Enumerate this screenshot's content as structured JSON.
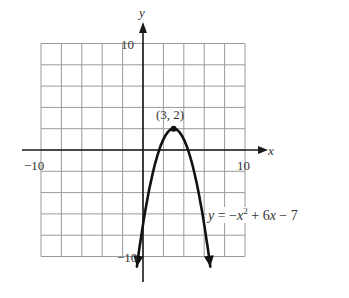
{
  "chart_data": {
    "type": "line",
    "title": "",
    "xlabel": "x",
    "ylabel": "y",
    "xlim": [
      -10,
      10
    ],
    "ylim": [
      -10,
      10
    ],
    "grid": true,
    "grid_step": 2,
    "tick_labels": {
      "x": [
        {
          "value": -10,
          "label": "−10"
        },
        {
          "value": 10,
          "label": "10"
        }
      ],
      "y": [
        {
          "value": 10,
          "label": "10"
        },
        {
          "value": -10,
          "label": "−10"
        }
      ]
    },
    "series": [
      {
        "name": "y = -x^2 + 6x - 7",
        "equation": "y = −x² + 6x − 7",
        "coefficients": {
          "a": -1,
          "b": 6,
          "c": -7
        },
        "arrows_at_ends": true,
        "x": [
          -0.6,
          0,
          1,
          2,
          3,
          4,
          5,
          6,
          6.6
        ],
        "values": [
          -11.0,
          -7,
          -2,
          1,
          2,
          1,
          -2,
          -7,
          -11.0
        ]
      }
    ],
    "annotations": [
      {
        "type": "point",
        "x": 3,
        "y": 2,
        "label": "(3, 2)"
      },
      {
        "type": "text",
        "label": "y = −x² + 6x − 7",
        "x": 6.2,
        "y": -6
      }
    ]
  },
  "labels": {
    "y_axis": "y",
    "x_axis": "x",
    "y_top_tick": "10",
    "y_bottom_tick": "−10",
    "x_left_tick": "−10",
    "x_right_tick": "10",
    "vertex": "(3, 2)",
    "equation_y": "y",
    "equation_eq": " = −",
    "equation_x": "x",
    "equation_exp": "2",
    "equation_mid": " + 6",
    "equation_x2": "x",
    "equation_end": " − 7"
  },
  "colors": {
    "grid": "#9a9a9a",
    "axis": "#1a1a1a",
    "curve": "#111111",
    "text": "#333333"
  }
}
